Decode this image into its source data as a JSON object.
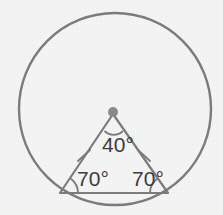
{
  "figure": {
    "background_color": "#f6f6f6",
    "stroke_color": "#7b7b7b",
    "label_color": "#3a3a3a",
    "vertex_dot_color": "#8a8a8a",
    "circle": {
      "name": "circumscribed-circle",
      "center_x": 115,
      "center_y": 109,
      "radius": 96,
      "stroke_width": 2.4
    },
    "triangle": {
      "name": "isosceles-triangle",
      "stroke_width": 2.2,
      "vertices": [
        {
          "name": "apex",
          "x": 113,
          "y": 114
        },
        {
          "name": "bottom-left",
          "x": 60,
          "y": 193
        },
        {
          "name": "bottom-right",
          "x": 168,
          "y": 193
        }
      ]
    },
    "vertex_dot": {
      "name": "apex-vertex-dot",
      "x": 113,
      "y": 112,
      "radius": 5
    },
    "angles": [
      {
        "name": "apex-angle",
        "label": "40°",
        "value": 40,
        "unit": "degrees",
        "label_x": 118,
        "label_y": 152,
        "anchor": "middle",
        "arc": "M 104.5 131 A 13 13 0 0 0 123 131"
      },
      {
        "name": "base-angle-left",
        "label": "70°",
        "value": 70,
        "unit": "degrees",
        "label_x": 93,
        "label_y": 186,
        "anchor": "middle",
        "arc": "M 78 193 A 18 18 0 0 0 70.9 178.7"
      },
      {
        "name": "base-angle-right",
        "label": "70°",
        "value": 70,
        "unit": "degrees",
        "label_x": 148,
        "label_y": 186,
        "anchor": "middle",
        "arc": "M 157.1 178.7 A 18 18 0 0 0 150 193"
      }
    ],
    "congruence_ticks": [
      {
        "name": "tick-mark-left-side",
        "x1": 78,
        "y1": 161,
        "x2": 90,
        "y2": 150
      },
      {
        "name": "tick-mark-right-side",
        "x1": 138,
        "y1": 150,
        "x2": 150,
        "y2": 161
      }
    ]
  }
}
